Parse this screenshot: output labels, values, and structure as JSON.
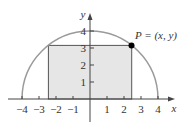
{
  "figure": {
    "type": "semicircle-inscribed-rectangle",
    "point_label": "P = (x, y)",
    "x_axis_label": "x",
    "y_axis_label": "y",
    "x_ticks": [
      "−4",
      "−3",
      "−2",
      "−1",
      "1",
      "2",
      "3",
      "4"
    ],
    "y_ticks": [
      "1",
      "2",
      "3",
      "4"
    ],
    "radius": 4,
    "point": {
      "x": 2.45,
      "y": 3.15
    },
    "colors": {
      "curve": "#999999",
      "rectangle_fill": "#e6e6e6",
      "rectangle_stroke": "#555555",
      "axis": "#444444",
      "point": "#000000"
    }
  }
}
